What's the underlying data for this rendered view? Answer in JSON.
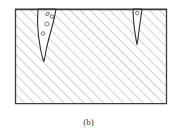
{
  "figure": {
    "caption": "(b)",
    "kind": "cross-section-diagram",
    "colors": {
      "background": "#ffffff",
      "hatch_line": "#a8a8a8",
      "border_line": "#3c3c3c",
      "crack_outline": "#2e2e2e",
      "void_outline": "#6a6a6a",
      "crack_fill": "#ffffff",
      "caption_text": "#3a3a3a"
    },
    "frame": {
      "x": 15,
      "y": 9,
      "width": 152,
      "height": 95,
      "border_width": 1.6
    },
    "hatch": {
      "angle_deg": 45,
      "spacing_px": 7,
      "stroke_width": 1.1
    },
    "cracks": [
      {
        "id": "left-crack",
        "label": "wide wedge crack",
        "mouth_x_start": 38,
        "mouth_x_end": 56,
        "tip_y": 61,
        "path": "M 38 9 L 37.5 22 L 38.5 36 L 40.5 49 L 42.5 58 L 43.8 61.5 L 44.6 58.5 L 46.5 48 L 49 38 L 52 27 L 54.5 17 L 56 9 Z",
        "voids": [
          {
            "cx": 47.5,
            "cy": 14.0,
            "rx": 2.0,
            "ry": 1.3,
            "rot": -25
          },
          {
            "cx": 52.0,
            "cy": 16.5,
            "rx": 1.9,
            "ry": 1.6,
            "rot": 10
          },
          {
            "cx": 47.0,
            "cy": 24.0,
            "rx": 2.2,
            "ry": 2.0,
            "rot": 0
          },
          {
            "cx": 43.0,
            "cy": 33.5,
            "rx": 1.9,
            "ry": 1.7,
            "rot": 0
          }
        ]
      },
      {
        "id": "right-crack",
        "label": "narrow fissure crack",
        "mouth_x_start": 133,
        "mouth_x_end": 142,
        "tip_y": 45,
        "path": "M 133 9 L 133.5 20 L 134.6 30 L 136.0 39 L 136.9 44.5 L 137.8 40 L 139.2 29 L 140.6 19 L 142 9 Z",
        "voids": [
          {
            "cx": 137.2,
            "cy": 13.2,
            "rx": 1.7,
            "ry": 1.8,
            "rot": 0
          }
        ]
      }
    ]
  }
}
